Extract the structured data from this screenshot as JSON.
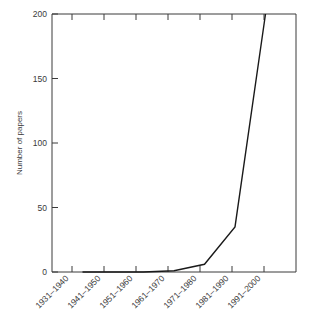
{
  "chart_data": {
    "type": "line",
    "title": "",
    "xlabel": "",
    "ylabel": "Number of papers",
    "categories": [
      "1931–1940",
      "1941–1950",
      "1951–1960",
      "1961–1970",
      "1971–1980",
      "1981–1990",
      "1991–2000"
    ],
    "values": [
      0,
      0,
      0,
      1,
      6,
      35,
      200
    ],
    "ylim": [
      0,
      200
    ],
    "yticks": [
      0,
      50,
      100,
      150,
      200
    ],
    "ytick_labels": [
      "0",
      "50",
      "100",
      "150",
      "200"
    ],
    "grid": false,
    "legend": null,
    "series": [
      {
        "name": "Number of papers",
        "values": [
          0,
          0,
          0,
          1,
          6,
          35,
          200
        ],
        "color": "#1a1a1a"
      }
    ],
    "colors": {
      "line": "#1a1a1a",
      "axis": "#3a3a3a",
      "text": "#3a3a3a",
      "background": "#ffffff"
    }
  }
}
